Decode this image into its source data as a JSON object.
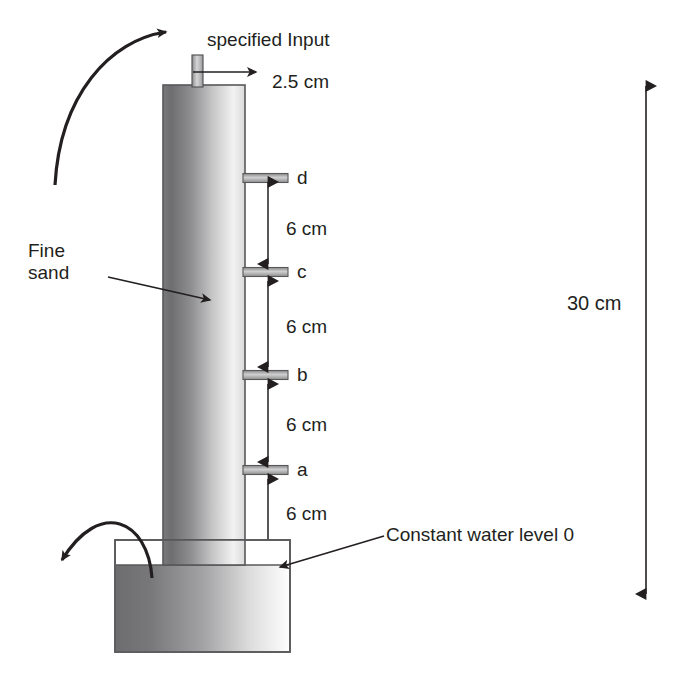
{
  "figure": {
    "title_label": "specified Input",
    "inlet_diameter_label": "2.5 cm",
    "material_label": "Fine\nsand",
    "water_level_label": "Constant water level 0",
    "total_height_label": "30 cm",
    "ports": [
      {
        "id": "d",
        "label": "d",
        "y": 178
      },
      {
        "id": "c",
        "label": "c",
        "y": 272
      },
      {
        "id": "b",
        "label": "b",
        "y": 375
      },
      {
        "id": "a",
        "label": "a",
        "y": 470
      }
    ],
    "spacings": [
      {
        "label": "6 cm",
        "between": "d-c",
        "y": 228
      },
      {
        "label": "6 cm",
        "between": "c-b",
        "y": 326
      },
      {
        "label": "6 cm",
        "between": "b-a",
        "y": 424
      },
      {
        "label": "6 cm",
        "between": "a-water",
        "y": 513
      }
    ],
    "colors": {
      "ink": "#231f20",
      "outline": "#58585a",
      "sand_dark": "#6e6e70",
      "sand_light": "#fbfbfb",
      "reservoir_dark": "#6e6e70",
      "reservoir_light": "#fdfdfd"
    },
    "geometry": {
      "column": {
        "x": 163,
        "y": 85,
        "w": 82,
        "h": 480
      },
      "inlet_tube": {
        "x": 192,
        "y": 55,
        "w": 11,
        "h": 32
      },
      "reservoir": {
        "x": 115,
        "y": 540,
        "w": 175,
        "h": 112
      },
      "water_line_y": 565,
      "dimension_line_x": 268,
      "port_tube": {
        "x": 243,
        "w": 45,
        "h": 9
      },
      "total_arrow": {
        "x": 646,
        "y1": 80,
        "y2": 600
      }
    }
  }
}
